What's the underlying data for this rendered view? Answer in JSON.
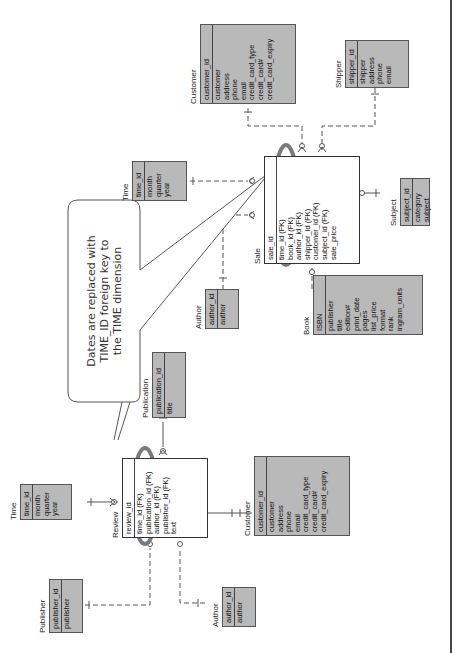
{
  "callout": {
    "lines": [
      "Dates are replaced with",
      "TIME_ID foreign key to",
      "the TIME dimension"
    ]
  },
  "upper_schema": {
    "customer": {
      "title": "Customer",
      "pk": "customer_id",
      "attrs": [
        "customer",
        "address",
        "phone",
        "email",
        "credit_card_type",
        "credit_card#",
        "credit_card_expiry"
      ]
    },
    "shipper": {
      "title": "Shipper",
      "pk": "shipper_id",
      "attrs": [
        "shipper",
        "address",
        "phone",
        "email"
      ]
    },
    "time": {
      "title": "Time",
      "pk": "time_id",
      "attrs": [
        "month",
        "quarter",
        "year"
      ]
    },
    "sale": {
      "title": "Sale",
      "pk": "sale_id",
      "attrs": [
        "time_id (FK)",
        "book_id (FK)",
        "author_id (FK)",
        "shipper_id (FK)",
        "customer_id (FK)",
        "subject_id (FK)",
        "sale_price"
      ]
    },
    "subject": {
      "title": "Subject",
      "pk": "subject_id",
      "attrs": [
        "category",
        "subject"
      ]
    },
    "author": {
      "title": "Author",
      "pk": "author_id",
      "attrs": [
        "author"
      ]
    },
    "book": {
      "title": "Book",
      "pk": "ISBN",
      "attrs": [
        "publisher",
        "title",
        "edition#",
        "print_date",
        "pages",
        "list_price",
        "format",
        "rank",
        "ingram_units"
      ]
    }
  },
  "lower_schema": {
    "publication": {
      "title": "Publication",
      "pk": "publication_id",
      "attrs": [
        "title"
      ]
    },
    "time": {
      "title": "Time",
      "pk": "time_id",
      "attrs": [
        "month",
        "quarter",
        "year"
      ]
    },
    "review": {
      "title": "Review",
      "pk": "review_id",
      "attrs": [
        "time_id (FK)",
        "publication_id (FK)",
        "author_id (FK)",
        "publisher_id (FK)",
        "text"
      ]
    },
    "customer": {
      "title": "Customer",
      "pk": "customer_id",
      "attrs": [
        "customer",
        "address",
        "phone",
        "email",
        "credit_card_type",
        "credit_card#",
        "credit_card_expiry"
      ]
    },
    "publisher": {
      "title": "Publisher",
      "pk": "publisher_id",
      "attrs": [
        "publisher"
      ]
    },
    "author": {
      "title": "Author",
      "pk": "author_id",
      "attrs": [
        "author"
      ]
    }
  },
  "colors": {
    "entity_fill": "#b9b9b9",
    "fact_fill": "#ffffff",
    "highlight_ellipse": "#7a7a7a",
    "callout_border": "#555555",
    "line": "#555555"
  }
}
